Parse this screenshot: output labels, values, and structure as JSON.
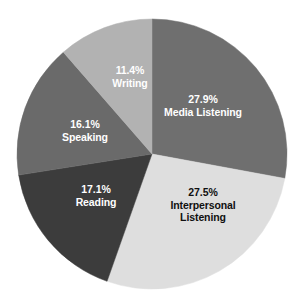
{
  "chart_data": {
    "type": "pie",
    "title": "",
    "subtitle": "",
    "xlabel": "",
    "ylabel": "",
    "legend_position": "none",
    "grid": false,
    "labels_inside_slices": true,
    "start_angle_deg": 0,
    "direction": "clockwise",
    "categories": [
      "Media Listening",
      "Interpersonal Listening",
      "Reading",
      "Speaking",
      "Writing"
    ],
    "values": [
      27.9,
      27.5,
      17.1,
      16.1,
      11.4
    ],
    "value_unit": "%",
    "slices": [
      {
        "name": "Media Listening",
        "percent_text": "27.9%",
        "value": 27.9,
        "color": "#6f6f6f",
        "text_color": "#ffffff"
      },
      {
        "name": "Interpersonal Listening",
        "percent_text": "27.5%",
        "value": 27.5,
        "color": "#dedede",
        "text_color": "#101010"
      },
      {
        "name": "Reading",
        "percent_text": "17.1%",
        "value": 17.1,
        "color": "#3c3c3c",
        "text_color": "#ffffff"
      },
      {
        "name": "Speaking",
        "percent_text": "16.1%",
        "value": 16.1,
        "color": "#6a6a6a",
        "text_color": "#ffffff"
      },
      {
        "name": "Writing",
        "percent_text": "11.4%",
        "value": 11.4,
        "color": "#b2b2b2",
        "text_color": "#ffffff"
      }
    ],
    "labels": {
      "media_pct": "27.9%",
      "media_name": "Media Listening",
      "interpersonal_pct": "27.5%",
      "interpersonal_name_line1": "Interpersonal",
      "interpersonal_name_line2": "Listening",
      "reading_pct": "17.1%",
      "reading_name": "Reading",
      "speaking_pct": "16.1%",
      "speaking_name": "Speaking",
      "writing_pct": "11.4%",
      "writing_name": "Writing"
    },
    "background_color": "#ffffff",
    "center": {
      "x": 152,
      "y": 154
    },
    "radius": 135
  }
}
